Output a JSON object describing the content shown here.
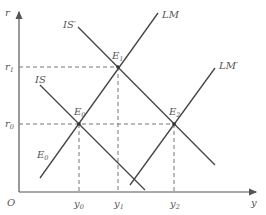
{
  "diagram": {
    "type": "IS-LM diagram",
    "axes": {
      "y_label": "r",
      "x_label": "y",
      "origin_label": "O"
    },
    "curves": [
      {
        "id": "LM",
        "label": "LM",
        "label_sup": ""
      },
      {
        "id": "LM_prime",
        "label": "LM",
        "label_sup": "′"
      },
      {
        "id": "IS",
        "label": "IS",
        "label_sup": ""
      },
      {
        "id": "IS_prime",
        "label": "IS",
        "label_sup": "′"
      }
    ],
    "points": [
      {
        "id": "E0",
        "label": "E",
        "sub": "0"
      },
      {
        "id": "E1",
        "label": "E",
        "sub": "1"
      },
      {
        "id": "E2",
        "label": "E",
        "sub": "2"
      },
      {
        "id": "E0_lower",
        "label": "E",
        "sub": "0"
      }
    ],
    "y_ticks": [
      {
        "label": "r",
        "sub": "1"
      },
      {
        "label": "r",
        "sub": "0"
      }
    ],
    "x_ticks": [
      {
        "label": "y",
        "sub": "0"
      },
      {
        "label": "y",
        "sub": "1"
      },
      {
        "label": "y",
        "sub": "2"
      }
    ],
    "colors": {
      "line": "#444444",
      "dash": "#777777",
      "text": "#555555"
    }
  }
}
